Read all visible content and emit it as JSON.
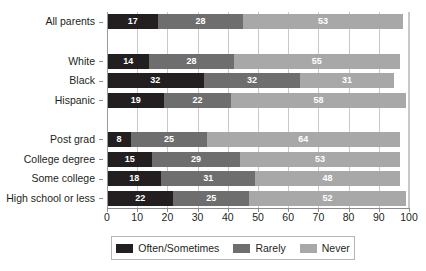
{
  "chart_data": {
    "type": "bar",
    "orientation": "horizontal",
    "stacked": true,
    "title": "",
    "subtitle": "",
    "xlabel": "",
    "ylabel": "",
    "xlim": [
      0,
      100
    ],
    "grid": true,
    "legend_position": "bottom",
    "categories": [
      "All parents",
      "White",
      "Black",
      "Hispanic",
      "Post grad",
      "College degree",
      "Some college",
      "High school or less"
    ],
    "series": [
      {
        "name": "Often/Sometimes",
        "color": "#231f20",
        "values": [
          17,
          14,
          32,
          19,
          8,
          15,
          18,
          22
        ]
      },
      {
        "name": "Rarely",
        "color": "#6e6e6e",
        "values": [
          28,
          28,
          32,
          22,
          25,
          29,
          31,
          25
        ]
      },
      {
        "name": "Never",
        "color": "#a8a8a8",
        "values": [
          53,
          55,
          31,
          58,
          64,
          53,
          48,
          52
        ]
      }
    ],
    "xticks": [
      0,
      10,
      20,
      30,
      40,
      50,
      60,
      70,
      80,
      90,
      100
    ],
    "xticklabels": [
      "0",
      "10",
      "20",
      "30",
      "40",
      "50",
      "60",
      "70",
      "80",
      "90",
      "100"
    ],
    "group_breaks_after": [
      "All parents",
      "Hispanic"
    ],
    "value_label_color": "#ffffff"
  },
  "legend": {
    "items": [
      {
        "label": "Often/Sometimes",
        "color": "#231f20"
      },
      {
        "label": "Rarely",
        "color": "#6e6e6e"
      },
      {
        "label": "Never",
        "color": "#a8a8a8"
      }
    ]
  },
  "colors": {
    "often": "#231f20",
    "rarely": "#6e6e6e",
    "never": "#a8a8a8",
    "grid": "#c9c9c9",
    "axis": "#8d8d8d",
    "background": "#ffffff",
    "text": "#231f20"
  }
}
